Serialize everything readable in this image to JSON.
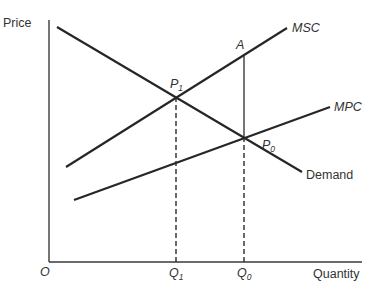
{
  "diagram": {
    "axes": {
      "y_label": "Price",
      "x_label": "Quantity",
      "origin_label": "O"
    },
    "curves": {
      "demand": {
        "label": "Demand",
        "from": [
          57,
          27
        ],
        "to": [
          302,
          172
        ]
      },
      "msc": {
        "label": "MSC",
        "from": [
          66,
          167
        ],
        "to": [
          287,
          28
        ]
      },
      "mpc": {
        "label": "MPC",
        "from": [
          74,
          200
        ],
        "to": [
          330,
          107
        ]
      }
    },
    "points": {
      "p1": {
        "label": "P",
        "sub": "1",
        "x": 176,
        "y": 97
      },
      "p0": {
        "label": "P",
        "sub": "0",
        "x": 244,
        "y": 137
      },
      "a": {
        "label": "A",
        "x": 244,
        "y": 54
      }
    },
    "quantities": {
      "q1": {
        "label": "Q",
        "sub": "1",
        "x": 176
      },
      "q0": {
        "label": "Q",
        "sub": "0",
        "x": 244
      }
    },
    "colors": {
      "line": "#262626",
      "text": "#333333",
      "background": "#ffffff"
    }
  }
}
